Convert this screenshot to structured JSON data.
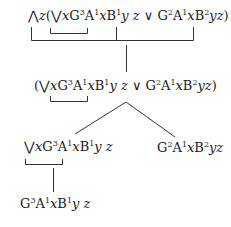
{
  "diagram": {
    "type": "proof-tree",
    "nodes": [
      {
        "id": "root",
        "formula": "⋀z(⋁xG³A¹xB¹y z ∨ G²A¹xB²yz)",
        "level": 0
      },
      {
        "id": "n1",
        "formula": "(⋁xG³A¹xB¹y z ∨ G²A¹xB²yz)",
        "level": 1,
        "parent": "root"
      },
      {
        "id": "n2-left",
        "formula": "⋁xG³A¹xB¹y z",
        "level": 2,
        "parent": "n1"
      },
      {
        "id": "n2-right",
        "formula": "G²A¹xB²yz",
        "level": 2,
        "parent": "n1"
      },
      {
        "id": "n3",
        "formula": "G³A¹xB¹y z",
        "level": 3,
        "parent": "n2-left"
      }
    ],
    "edges": [
      {
        "from": "root",
        "to": "n1",
        "kind": "stem"
      },
      {
        "from": "n1",
        "to": "n2-left",
        "kind": "branch"
      },
      {
        "from": "n1",
        "to": "n2-right",
        "kind": "branch"
      },
      {
        "from": "n2-left",
        "to": "n3",
        "kind": "stem"
      }
    ],
    "scope_brackets": [
      {
        "node": "root",
        "spans": "xG³A¹x",
        "kind": "inner"
      },
      {
        "node": "root",
        "spans": "z(...)",
        "kind": "outer"
      },
      {
        "node": "n1",
        "spans": "xG³A¹x",
        "kind": "inner"
      },
      {
        "node": "n2-left",
        "spans": "xG³A¹x",
        "kind": "inner"
      }
    ]
  },
  "symbols": {
    "forall": "⋀",
    "exists": "⋁",
    "or": "∨"
  },
  "f0": {
    "a": "⋀",
    "b": "z",
    "c": "(",
    "d": "⋁",
    "e": "x",
    "f": "G",
    "g": "3",
    "h": "A",
    "i": "1",
    "j": "x",
    "k": "B",
    "l": "1",
    "m": "y",
    "n": " ",
    "o": "z",
    "p": " ∨ ",
    "q": "G",
    "r": "2",
    "s": "A",
    "t": "1",
    "u": "x",
    "v": "B",
    "w": "2",
    "x": "yz",
    "y": ")"
  },
  "f1": {
    "c": "(",
    "d": "⋁",
    "e": "x",
    "f": "G",
    "g": "3",
    "h": "A",
    "i": "1",
    "j": "x",
    "k": "B",
    "l": "1",
    "m": "y",
    "n": " ",
    "o": "z",
    "p": " ∨ ",
    "q": "G",
    "r": "2",
    "s": "A",
    "t": "1",
    "u": "x",
    "v": "B",
    "w": "2",
    "x": "yz",
    "y": ")"
  },
  "f2l": {
    "d": "⋁",
    "e": "x",
    "f": "G",
    "g": "3",
    "h": "A",
    "i": "1",
    "j": "x",
    "k": "B",
    "l": "1",
    "m": "y",
    "n": " ",
    "o": "z"
  },
  "f2r": {
    "q": "G",
    "r": "2",
    "s": "A",
    "t": "1",
    "u": "x",
    "v": "B",
    "w": "2",
    "x": "yz"
  },
  "f3": {
    "f": "G",
    "g": "3",
    "h": "A",
    "i": "1",
    "j": "x",
    "k": "B",
    "l": "1",
    "m": "y",
    "n": " ",
    "o": "z"
  }
}
